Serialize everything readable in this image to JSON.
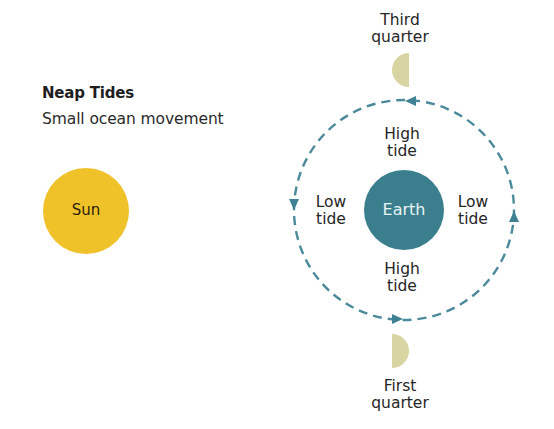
{
  "header": {
    "title": "Neap Tides",
    "subtitle": "Small ocean movement"
  },
  "bodies": {
    "sun": {
      "label": "Sun",
      "color": "#f0c22a"
    },
    "earth": {
      "label": "Earth",
      "color": "#3b7f8e"
    },
    "moon_color": "#d8d5a2"
  },
  "moon_phases": {
    "top": {
      "line1": "Third",
      "line2": "quarter"
    },
    "bottom": {
      "line1": "First",
      "line2": "quarter"
    }
  },
  "tides": {
    "top": {
      "line1": "High",
      "line2": "tide"
    },
    "bottom": {
      "line1": "High",
      "line2": "tide"
    },
    "left": {
      "line1": "Low",
      "line2": "tide"
    },
    "right": {
      "line1": "Low",
      "line2": "tide"
    }
  },
  "orbit": {
    "style": "dashed",
    "color": "#4a8a9a",
    "direction": "counter-clockwise"
  }
}
